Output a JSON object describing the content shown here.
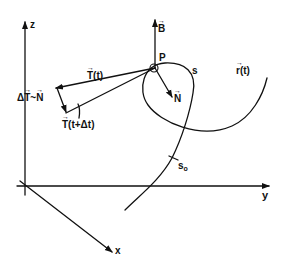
{
  "diagram": {
    "axes": {
      "z": "z",
      "y": "y",
      "x": "x"
    },
    "point_label": "P",
    "arc_length_label": "s",
    "arc_length_start_label": "s",
    "arc_length_start_sub": "o",
    "curve_label": "r",
    "curve_label_arg": "(t)",
    "binormal_label": "B",
    "normal_label": "N",
    "tangent_label": "T",
    "tangent_label_arg": "(t)",
    "tangent_next_label": "T",
    "tangent_next_arg": "(t+Δt)",
    "delta_label_prefix": "Δ",
    "delta_label_T": "T",
    "delta_label_sep": "~",
    "delta_label_N": "N",
    "colors": {
      "ink": "#111111",
      "background": "#ffffff"
    }
  }
}
